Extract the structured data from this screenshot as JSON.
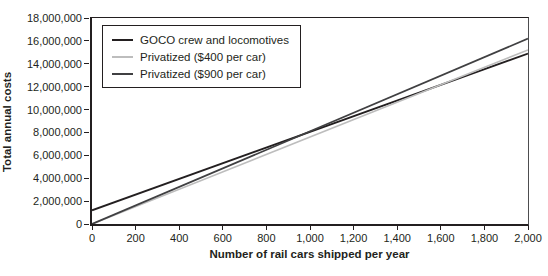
{
  "chart_data": {
    "type": "line",
    "title": "",
    "xlabel": "Number of rail cars shipped per year",
    "ylabel": "Total annual costs",
    "xlim": [
      0,
      2000
    ],
    "ylim": [
      0,
      18000000
    ],
    "x_tick_step": 200,
    "y_tick_step": 2000000,
    "x_ticks": [
      "0",
      "200",
      "400",
      "600",
      "800",
      "1,000",
      "1,200",
      "1,400",
      "1,600",
      "1,800",
      "2,000"
    ],
    "y_ticks": [
      "0",
      "2,000,000",
      "4,000,000",
      "6,000,000",
      "8,000,000",
      "10,000,000",
      "12,000,000",
      "14,000,000",
      "16,000,000",
      "18,000,000"
    ],
    "grid": false,
    "legend_position": "top-left-inside",
    "frame_color": "#231f20",
    "background_color": "#ffffff",
    "series": [
      {
        "id": "goco",
        "name": "GOCO crew and locomotives",
        "color": "#231f20",
        "stroke_width": 1.8,
        "x": [
          0,
          2000
        ],
        "values": [
          1200000,
          14900000
        ]
      },
      {
        "id": "privatized-400",
        "name": "Privatized ($400 per car)",
        "color": "#bdbdbd",
        "stroke_width": 1.6,
        "x": [
          0,
          2000
        ],
        "values": [
          0,
          15200000
        ]
      },
      {
        "id": "privatized-900",
        "name": "Privatized ($900 per car)",
        "color": "#404042",
        "stroke_width": 1.8,
        "x": [
          0,
          2000
        ],
        "values": [
          0,
          16200000
        ]
      }
    ]
  }
}
